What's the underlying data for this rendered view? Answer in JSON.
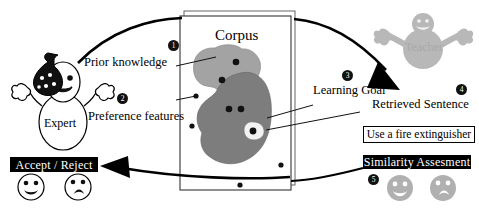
{
  "diagram": {
    "labels": {
      "prior_knowledge": "Prior knowledge",
      "preference_features": "Preference features",
      "corpus": "Corpus",
      "learning_goal": "Learning Goal",
      "retrieved_sentence": "Retrieved Sentence",
      "expert": "Expert",
      "teacher": "Teacher"
    },
    "chips": {
      "accept_reject": "Accept / Reject",
      "similarity_assessment": "Similarity Assesment"
    },
    "sentence_box": {
      "text": "Use a fire extinguisher"
    },
    "badges": [
      {
        "id": "1",
        "label": "1"
      },
      {
        "id": "2",
        "label": "2"
      },
      {
        "id": "3",
        "label": "3"
      },
      {
        "id": "4",
        "label": "4"
      },
      {
        "id": "5",
        "label": "5"
      }
    ],
    "colors": {
      "ink": "#000000",
      "paper": "#ffffff",
      "blob_light": "#a3a3a3",
      "blob_dark": "#7d7d7d",
      "teacher_gray": "#b8b8b8",
      "face_gray": "#b0b0b0",
      "chip_bg": "#000000",
      "chip_text": "#ffffff"
    },
    "icons": {
      "expert_hat": "graduation-cap-icon",
      "happy_face": "happy-face-icon",
      "sad_face": "sad-face-icon",
      "corpus_stack": "document-stack-icon"
    }
  }
}
